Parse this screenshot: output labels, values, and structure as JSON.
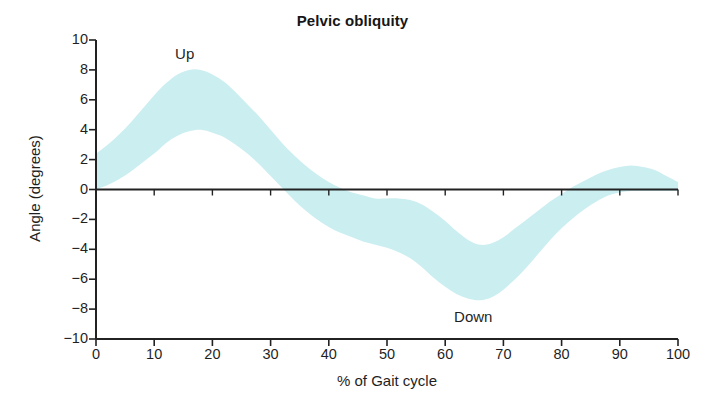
{
  "chart_data": {
    "type": "area",
    "title": "Pelvic obliquity",
    "xlabel": "% of Gait cycle",
    "ylabel": "Angle (degrees)",
    "xlim": [
      0,
      100
    ],
    "ylim": [
      -10,
      10
    ],
    "xticks": [
      "0",
      "10",
      "20",
      "30",
      "40",
      "50",
      "60",
      "70",
      "80",
      "90",
      "100"
    ],
    "yticks": [
      "10",
      "8",
      "6",
      "4",
      "2",
      "0",
      "−2",
      "−4",
      "−6",
      "−8",
      "−10"
    ],
    "grid": false,
    "legend": false,
    "band_color": "#cbeef1",
    "axis_color": "#222222",
    "annotations": [
      {
        "text": "Up",
        "x": 16,
        "y": 9.0
      },
      {
        "text": "Down",
        "x": 66,
        "y": -8.6
      }
    ],
    "series": [
      {
        "name": "Normal range (± 1 SD band)",
        "x": [
          0,
          2,
          4,
          6,
          8,
          10,
          12,
          14,
          16,
          18,
          20,
          22,
          24,
          26,
          28,
          30,
          32,
          34,
          36,
          38,
          40,
          42,
          44,
          46,
          48,
          50,
          52,
          54,
          56,
          58,
          60,
          62,
          64,
          66,
          68,
          70,
          72,
          74,
          76,
          78,
          80,
          82,
          84,
          86,
          88,
          90,
          92,
          94,
          96,
          98,
          100
        ],
        "upper": [
          2.4,
          3.0,
          3.7,
          4.5,
          5.4,
          6.3,
          7.1,
          7.7,
          8.0,
          8.0,
          7.7,
          7.2,
          6.5,
          5.7,
          4.9,
          4.0,
          3.1,
          2.3,
          1.6,
          1.0,
          0.5,
          0.1,
          -0.2,
          -0.4,
          -0.6,
          -0.6,
          -0.6,
          -0.7,
          -1.0,
          -1.5,
          -2.1,
          -2.8,
          -3.4,
          -3.7,
          -3.6,
          -3.2,
          -2.6,
          -2.0,
          -1.4,
          -0.8,
          -0.3,
          0.2,
          0.6,
          1.0,
          1.3,
          1.5,
          1.6,
          1.5,
          1.3,
          0.9,
          0.5
        ],
        "lower": [
          0.0,
          0.3,
          0.7,
          1.2,
          1.8,
          2.4,
          3.1,
          3.6,
          3.9,
          4.0,
          3.8,
          3.5,
          3.0,
          2.4,
          1.7,
          0.9,
          0.1,
          -0.7,
          -1.4,
          -2.0,
          -2.5,
          -2.9,
          -3.2,
          -3.5,
          -3.7,
          -3.9,
          -4.2,
          -4.6,
          -5.2,
          -5.9,
          -6.5,
          -7.0,
          -7.3,
          -7.4,
          -7.2,
          -6.7,
          -6.0,
          -5.2,
          -4.3,
          -3.4,
          -2.6,
          -1.9,
          -1.3,
          -0.8,
          -0.4,
          -0.2,
          -0.1,
          -0.1,
          -0.1,
          -0.1,
          -0.1
        ]
      }
    ],
    "zero_line": true
  }
}
